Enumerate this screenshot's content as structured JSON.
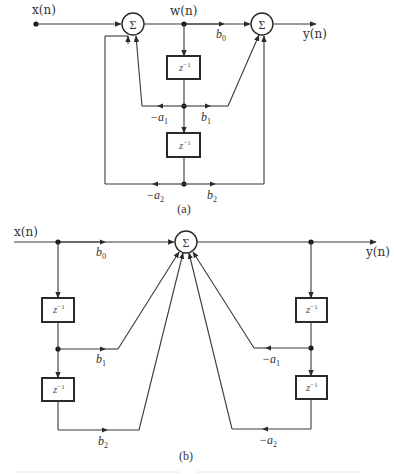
{
  "figure_a": {
    "caption": "(a)",
    "input_label": "x(n)",
    "intermediate_label": "w(n)",
    "output_label": "y(n)",
    "summer_symbol": "Σ",
    "delay_label": "z",
    "delay_exponent": "−1",
    "coefficients": {
      "b0": {
        "base": "b",
        "sub": "0"
      },
      "b1": {
        "base": "b",
        "sub": "1"
      },
      "b2": {
        "base": "b",
        "sub": "2"
      },
      "neg_a1": {
        "base": "−a",
        "sub": "1"
      },
      "neg_a2": {
        "base": "−a",
        "sub": "2"
      }
    }
  },
  "figure_b": {
    "caption": "(b)",
    "input_label": "x(n)",
    "output_label": "y(n)",
    "summer_symbol": "Σ",
    "delay_label": "z",
    "delay_exponent": "−1",
    "coefficients": {
      "b0": {
        "base": "b",
        "sub": "0"
      },
      "b1": {
        "base": "b",
        "sub": "1"
      },
      "b2": {
        "base": "b",
        "sub": "2"
      },
      "neg_a1": {
        "base": "−a",
        "sub": "1"
      },
      "neg_a2": {
        "base": "−a",
        "sub": "2"
      }
    }
  }
}
